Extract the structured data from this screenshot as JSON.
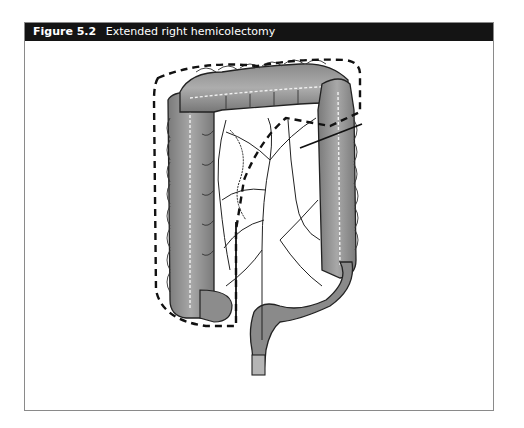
{
  "figure": {
    "number": "Figure 5.2",
    "title": "Extended right hemicolectomy"
  },
  "illustration": {
    "subject": "colon-anatomy",
    "annotation": "dashed-resection-boundary",
    "colors": {
      "header_bg": "#141414",
      "header_text": "#ffffff",
      "frame_border": "#8a8a8a",
      "colon_fill": "#9a9a9a",
      "colon_shade": "#6e6e6e",
      "line": "#111111"
    }
  }
}
